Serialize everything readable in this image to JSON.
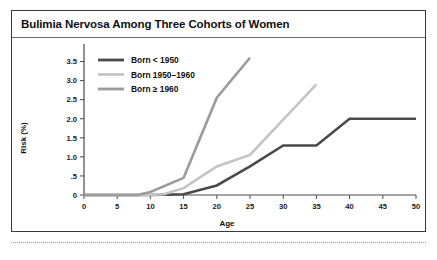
{
  "figure": {
    "title": "Bulimia Nervosa Among Three Cohorts of Women",
    "frame_color": "#3a3a3a",
    "title_rule_color": "#6b6b6b"
  },
  "chart_data": {
    "type": "line",
    "title": "Bulimia Nervosa Among Three Cohorts of Women",
    "xlabel": "Age",
    "ylabel": "Risk (%)",
    "xlim": [
      0,
      50
    ],
    "ylim": [
      0,
      3.75
    ],
    "grid": false,
    "legend_position": "top-left",
    "xticks": [
      0,
      5,
      10,
      15,
      20,
      25,
      30,
      35,
      40,
      45,
      50
    ],
    "xticklabels": [
      "0",
      "5",
      "10",
      "15",
      "20",
      "25",
      "30",
      "35",
      "40",
      "45",
      "50"
    ],
    "yticks": [
      0,
      0.5,
      1.0,
      1.5,
      2.0,
      2.5,
      3.0,
      3.5
    ],
    "yticklabels": [
      "0",
      ".5",
      "1.0",
      "1.5",
      "2.0",
      "2.5",
      "3.0",
      "3.5"
    ],
    "series": [
      {
        "name": "Born < 1950",
        "color": "#4a4a4a",
        "width": 2.6,
        "x": [
          0,
          10,
          15,
          20,
          25,
          30,
          35,
          40,
          50
        ],
        "y": [
          0,
          0,
          0.02,
          0.25,
          0.75,
          1.3,
          1.3,
          2.0,
          2.0
        ]
      },
      {
        "name": "Born 1950–1960",
        "color": "#c4c4c4",
        "width": 2.6,
        "x": [
          0,
          10,
          12,
          15,
          20,
          25,
          35
        ],
        "y": [
          0,
          0,
          0.02,
          0.18,
          0.75,
          1.05,
          2.9
        ]
      },
      {
        "name": "Born ≥ 1960",
        "color": "#9b9b9b",
        "width": 2.6,
        "x": [
          0,
          8,
          10,
          15,
          20,
          25
        ],
        "y": [
          0,
          0,
          0.08,
          0.45,
          2.55,
          3.6
        ]
      }
    ]
  },
  "legend": {
    "items": [
      {
        "label": "Born < 1950",
        "color": "#4a4a4a"
      },
      {
        "label": "Born 1950–1960",
        "color": "#c4c4c4"
      },
      {
        "label": "Born ≥ 1960",
        "color": "#9b9b9b"
      }
    ]
  }
}
